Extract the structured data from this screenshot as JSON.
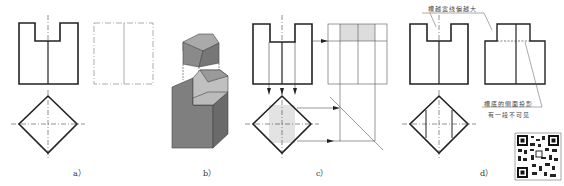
{
  "figures": [
    {
      "id": "a",
      "label": "a）"
    },
    {
      "id": "b",
      "label": "b）"
    },
    {
      "id": "c",
      "label": "c）"
    },
    {
      "id": "d",
      "label": "d）"
    }
  ],
  "annotations": {
    "top": "槽越宽线偏越大",
    "bottom_line1": "槽底的侧面投影",
    "bottom_line2": "有一段不可见"
  },
  "colors": {
    "line": "#222222",
    "thin": "#555555",
    "block_dark": "#7a7a7a",
    "block_mid": "#9a9a9a",
    "block_light": "#c8c8c8",
    "hatch": "#dddddd"
  },
  "qr_code": {
    "present": true
  }
}
